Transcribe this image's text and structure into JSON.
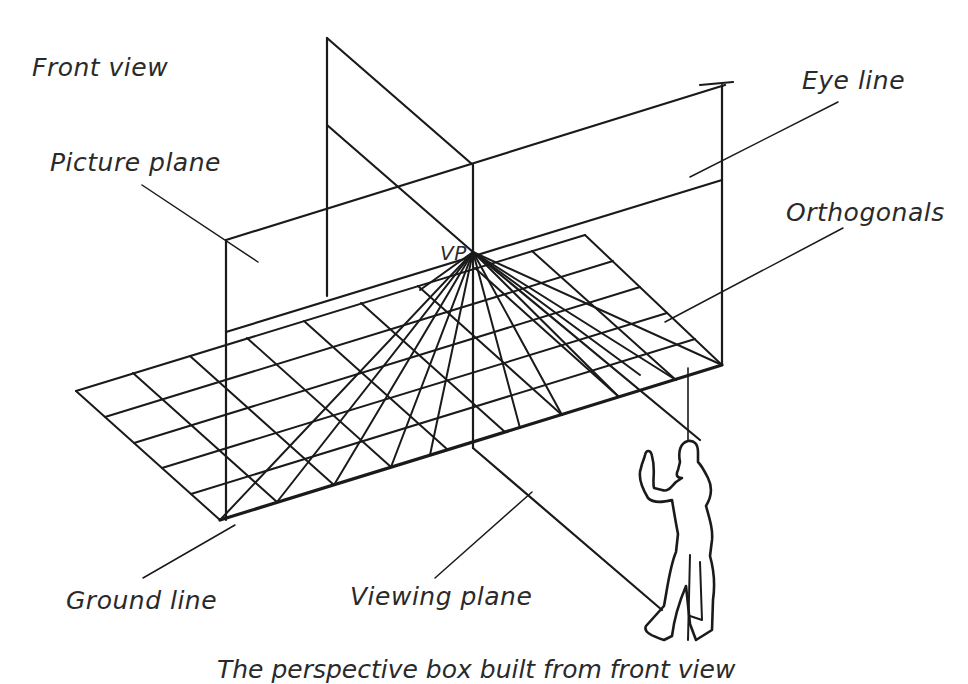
{
  "diagram": {
    "labels": {
      "front_view": "Front view",
      "eye_line": "Eye line",
      "picture_plane": "Picture plane",
      "orthogonals": "Orthogonals",
      "vanishing_point": "VP",
      "ground_line": "Ground line",
      "viewing_plane": "Viewing plane"
    },
    "caption": "The perspective box built from front view",
    "colors": {
      "ink": "#1a1a1a",
      "background": "#ffffff"
    }
  }
}
